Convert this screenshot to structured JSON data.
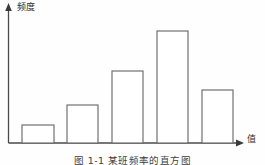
{
  "figure": {
    "caption": "图 1-1   某班频率的直方图",
    "background_color": "#fefefe",
    "line_color": "#6b6b6b",
    "axis_color": "#4a4a4a"
  },
  "axes": {
    "y_label": "频度",
    "x_label": "值",
    "y_axis_name": "frequency-axis",
    "x_axis_name": "value-axis",
    "y_arrow_icon": "arrow-up-icon",
    "x_arrow_icon": "arrow-right-icon"
  },
  "chart_data": {
    "type": "bar",
    "title": "",
    "subtitle": "",
    "xlabel": "值",
    "ylabel": "频度",
    "grid": false,
    "legend": "none",
    "categories": [
      "1",
      "2",
      "3",
      "4",
      "5"
    ],
    "values": [
      18,
      38,
      72,
      112,
      53
    ],
    "ylim": [
      0,
      135
    ],
    "bar_style": "outline",
    "bars": [
      {
        "index": 1,
        "x_left": 22,
        "x_right": 54,
        "top_y": 125,
        "height_px": 18
      },
      {
        "index": 2,
        "x_left": 67,
        "x_right": 98,
        "top_y": 105,
        "height_px": 38
      },
      {
        "index": 3,
        "x_left": 112,
        "x_right": 143,
        "top_y": 71,
        "height_px": 72
      },
      {
        "index": 4,
        "x_left": 157,
        "x_right": 188,
        "top_y": 31,
        "height_px": 112
      },
      {
        "index": 5,
        "x_left": 202,
        "x_right": 233,
        "top_y": 90,
        "height_px": 53
      }
    ],
    "baseline_y": 143,
    "y_axis_x": 8
  }
}
